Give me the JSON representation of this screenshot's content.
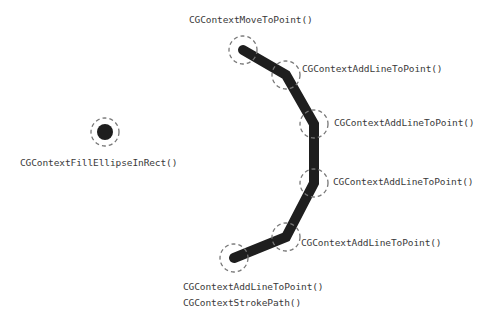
{
  "diagram": {
    "colors": {
      "background": "#ffffff",
      "stroke": "#1e1e1e",
      "dashed_ring": "#777777",
      "label": "#3a3a3a"
    },
    "dot": {
      "label": "CGContextFillEllipseInRect()",
      "cx": 105,
      "cy": 132,
      "r": 8,
      "ring_r": 14
    },
    "path": {
      "points": [
        {
          "x": 243,
          "y": 50,
          "label": "CGContextMoveToPoint()"
        },
        {
          "x": 286,
          "y": 75,
          "label": "CGContextAddLineToPoint()"
        },
        {
          "x": 314,
          "y": 124,
          "label": "CGContextAddLineToPoint()"
        },
        {
          "x": 314,
          "y": 183,
          "label": "CGContextAddLineToPoint()"
        },
        {
          "x": 286,
          "y": 237,
          "label": "CGContextAddLineToPoint()"
        },
        {
          "x": 234,
          "y": 258,
          "label": "CGContextAddLineToPoint()"
        }
      ],
      "final_label": "CGContextStrokePath()",
      "stroke_width": 10,
      "ring_r": 14
    }
  }
}
